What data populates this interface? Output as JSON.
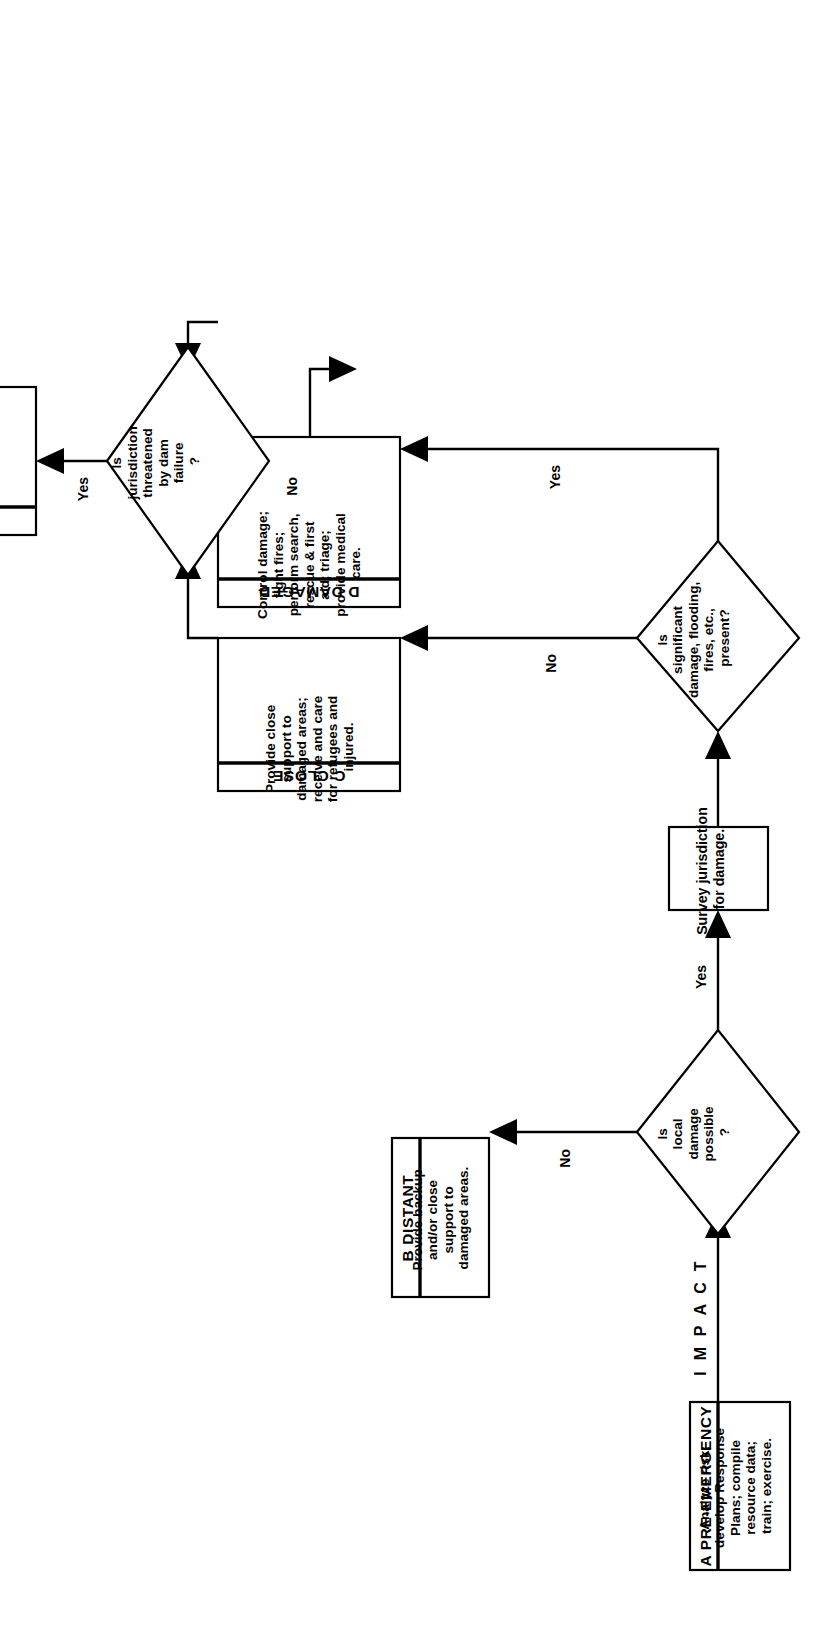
{
  "diagram": {
    "orientation": "rotated-90-ccw",
    "colors": {
      "stroke": "#000000",
      "fill": "#ffffff",
      "text": "#000000"
    }
  },
  "nodes": {
    "a": {
      "id": "A",
      "title": "A PRE-EMERGENCY",
      "body": [
        "Analyze risk;",
        "develop Response",
        "Plans; compile",
        "resource data;",
        "train; exercise."
      ]
    },
    "b": {
      "id": "B",
      "title": "B  DISTANT",
      "body": [
        "Provide backup",
        "and/or close",
        "support to",
        "damaged areas."
      ]
    },
    "c": {
      "id": "C",
      "title": "C  CLOSE",
      "body": [
        "Provide close",
        "support to",
        "damaged areas;",
        "receive and care",
        "for refugees and",
        "injured."
      ]
    },
    "d": {
      "id": "D",
      "title": "D  DAMAGED",
      "body": [
        "Control damage;",
        "fight fires;",
        "perform search,",
        "rescue & first",
        "aid; triage;",
        "provide medical",
        "care."
      ]
    },
    "e": {
      "id": "E",
      "title": "E  EVACUATE",
      "body": [
        "Evacuate",
        "threatened or",
        "untenable areas."
      ]
    },
    "survey": {
      "body": [
        "Survey jurisdiction",
        "for damage."
      ]
    },
    "decision1": {
      "body": [
        "Is",
        "local",
        "damage",
        "possible",
        "?"
      ]
    },
    "decision2": {
      "body": [
        "Is",
        "significant",
        "damage, flooding,",
        "fires, etc.,",
        "present?"
      ]
    },
    "decision3": {
      "body": [
        "Is",
        "jurisdiction",
        "threatened",
        "by dam",
        "failure",
        "?"
      ]
    }
  },
  "labels": {
    "impact": "I M P A C T",
    "d1_no": "No",
    "d1_yes": "Yes",
    "d2_no": "No",
    "d2_yes": "Yes",
    "d3_no": "No",
    "d3_yes": "Yes"
  }
}
